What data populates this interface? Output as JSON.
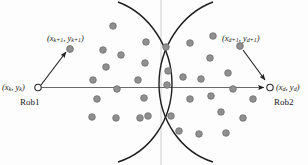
{
  "diagram": {
    "background_color": "#fdfdfd",
    "stroke_color": "#1e1e1e",
    "dot_fill": "#8f8f8f",
    "dot_stroke": "#6e6e6e",
    "axis_color": "#6a6a6a",
    "faint_line_color": "#cfcfcf",
    "labels": {
      "robot1_position": "(x",
      "robot1_position_sub1": "k",
      "robot1_position_mid": ", y",
      "robot1_position_sub2": "k",
      "robot1_position_end": ")",
      "robot1_name": "Rob1",
      "robot2_name": "Rob2"
    },
    "label_texts": {
      "left_current": "(x_k, y_k)",
      "left_next": "(x_k+1, y_k+1)",
      "right_current": "(x_d, y_d)",
      "right_next": "(x_d+1, y_d+1)",
      "robot1": "Rob1",
      "robot2": "Rob2"
    },
    "label_parts": {
      "left_current": {
        "open": "(x",
        "s1": "k",
        "mid": ", y",
        "s2": "k",
        "close": ")"
      },
      "left_next": {
        "open": "(x",
        "s1": "k+1",
        "mid": ", y",
        "s2": "k+1",
        "close": ")"
      },
      "right_current": {
        "open": "(x",
        "s1": "d",
        "mid": ", y",
        "s2": "d",
        "close": ")"
      },
      "right_next": {
        "open": "(x",
        "s1": "d+1",
        "mid": ", y",
        "s2": "d+1",
        "close": ")"
      }
    },
    "nodes": {
      "robot1_marker": {
        "cx": 38,
        "cy": 87.5,
        "r": 3.2
      },
      "robot2_marker": {
        "cx": 270,
        "cy": 87.5,
        "r": 3.2
      },
      "robot1_next_dot": {
        "cx": 70,
        "cy": 49,
        "r": 3.4
      },
      "robot2_next_dot": {
        "cx": 240,
        "cy": 46,
        "r": 3.4
      }
    },
    "axis": {
      "x1": 41,
      "y1": 87.5,
      "x2": 264,
      "y2": 87.5
    },
    "vertical_guide": {
      "x": 161,
      "y1": 0,
      "y2": 165
    },
    "arcs": {
      "left_arc": "M 118,2 C 150,14 172,48 172,84 C 172,120 150,152 118,162",
      "right_arc": "M 213,2 C 181,14 159,48 159,84 C 159,120 181,152 213,162"
    },
    "arrows": [
      {
        "name": "robot1-to-next",
        "x1": 41,
        "y1": 85,
        "x2": 66,
        "y2": 52
      },
      {
        "name": "next-to-robot2",
        "x1": 243,
        "y1": 50,
        "x2": 265,
        "y2": 80
      }
    ],
    "scatter_points": [
      {
        "cx": 113,
        "cy": 26
      },
      {
        "cx": 103,
        "cy": 50
      },
      {
        "cx": 121,
        "cy": 55
      },
      {
        "cx": 106,
        "cy": 67
      },
      {
        "cx": 93,
        "cy": 80
      },
      {
        "cx": 117,
        "cy": 89
      },
      {
        "cx": 97,
        "cy": 99
      },
      {
        "cx": 92,
        "cy": 117
      },
      {
        "cx": 116,
        "cy": 118
      },
      {
        "cx": 140,
        "cy": 118
      },
      {
        "cx": 146,
        "cy": 42
      },
      {
        "cx": 166,
        "cy": 47
      },
      {
        "cx": 145,
        "cy": 63
      },
      {
        "cx": 168,
        "cy": 71
      },
      {
        "cx": 138,
        "cy": 80
      },
      {
        "cx": 167,
        "cy": 85
      },
      {
        "cx": 144,
        "cy": 98
      },
      {
        "cx": 183,
        "cy": 77
      },
      {
        "cx": 148,
        "cy": 116
      },
      {
        "cx": 171,
        "cy": 116
      },
      {
        "cx": 179,
        "cy": 131
      },
      {
        "cx": 190,
        "cy": 43
      },
      {
        "cx": 213,
        "cy": 36
      },
      {
        "cx": 210,
        "cy": 58
      },
      {
        "cx": 201,
        "cy": 79
      },
      {
        "cx": 228,
        "cy": 73
      },
      {
        "cx": 190,
        "cy": 99
      },
      {
        "cx": 211,
        "cy": 96
      },
      {
        "cx": 233,
        "cy": 89
      },
      {
        "cx": 221,
        "cy": 112
      },
      {
        "cx": 199,
        "cy": 134
      },
      {
        "cx": 243,
        "cy": 118
      },
      {
        "cx": 253,
        "cy": 99
      },
      {
        "cx": 226,
        "cy": 133
      }
    ]
  }
}
